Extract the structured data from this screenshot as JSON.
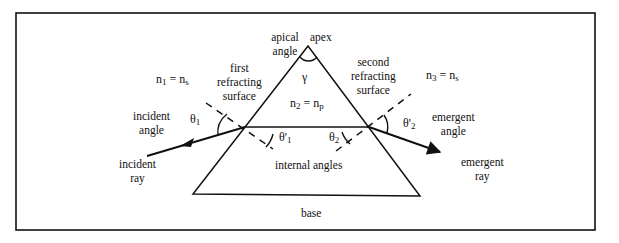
{
  "diagram": {
    "type": "prism-refraction",
    "colors": {
      "ink": "#111111",
      "background": "#ffffff"
    },
    "labels": {
      "apical_angle": "apical angle",
      "apex": "apex",
      "gamma": "γ",
      "n1_lhs": "n",
      "n1_sub": "1",
      "n1_rhs": " = n",
      "n1_rhs_sub": "s",
      "n2_lhs": "n",
      "n2_sub": "2",
      "n2_rhs": " = n",
      "n2_rhs_sub": "p",
      "n3_lhs": "n",
      "n3_sub": "3",
      "n3_rhs": " = n",
      "n3_rhs_sub": "s",
      "first_surface_1": "first",
      "first_surface_2": "refracting",
      "first_surface_3": "surface",
      "second_surface_1": "second",
      "second_surface_2": "refracting",
      "second_surface_3": "surface",
      "incident_angle_1": "incident",
      "incident_angle_2": "angle",
      "incident_ray_1": "incident",
      "incident_ray_2": "ray",
      "theta1": "θ",
      "theta1_sub": "1",
      "theta1p": "θ'",
      "theta1p_sub": "1",
      "theta2": "θ",
      "theta2_sub": "2",
      "theta2p": "θ'",
      "theta2p_sub": "2",
      "internal_angles": "internal angles",
      "emergent_angle_1": "emergent",
      "emergent_angle_2": "angle",
      "emergent_ray_1": "emergent",
      "emergent_ray_2": "ray",
      "base": "base"
    }
  }
}
